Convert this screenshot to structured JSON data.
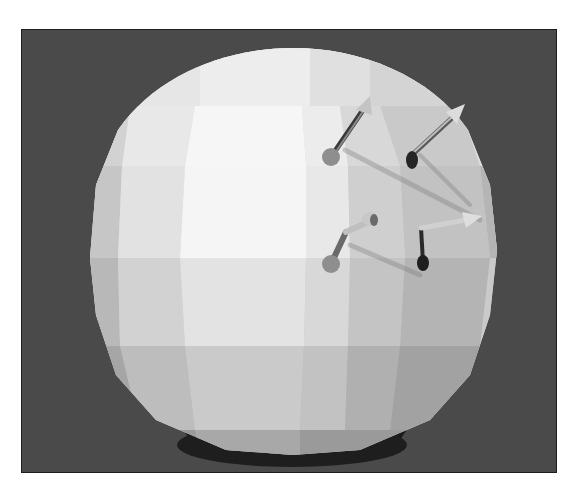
{
  "scene": {
    "description": "Low-poly shaded sphere rendered on dark gray background with four normal-vector arrows",
    "background_color": "#4a4a4a",
    "frame_border_color": "#1e1e1e",
    "sphere": {
      "center": [
        293,
        255
      ],
      "radius_x": 204,
      "radius_y": 205,
      "highlight_color": "#f4f4f4",
      "mid_color": "#cfcfcf",
      "shade_color": "#9a9a9a",
      "shadow_color": "#1c1c1c"
    },
    "arrows": [
      {
        "id": "arrow-1",
        "base": [
          331,
          157
        ],
        "tip": [
          370,
          96
        ],
        "base_color": "#8f8f8f",
        "tip_color": "#c9c9c9"
      },
      {
        "id": "arrow-2",
        "base": [
          412,
          158
        ],
        "tip": [
          464,
          106
        ],
        "base_color": "#2a2a2a",
        "tip_color": "#dddddd"
      },
      {
        "id": "arrow-3",
        "base": [
          331,
          264
        ],
        "tip": [
          373,
          218
        ],
        "base_color": "#8f8f8f",
        "tip_color": "#c9c9c9"
      },
      {
        "id": "arrow-4",
        "base": [
          423,
          262
        ],
        "tip": [
          479,
          216
        ],
        "base_color": "#222222",
        "tip_color": "#dddddd"
      }
    ]
  }
}
